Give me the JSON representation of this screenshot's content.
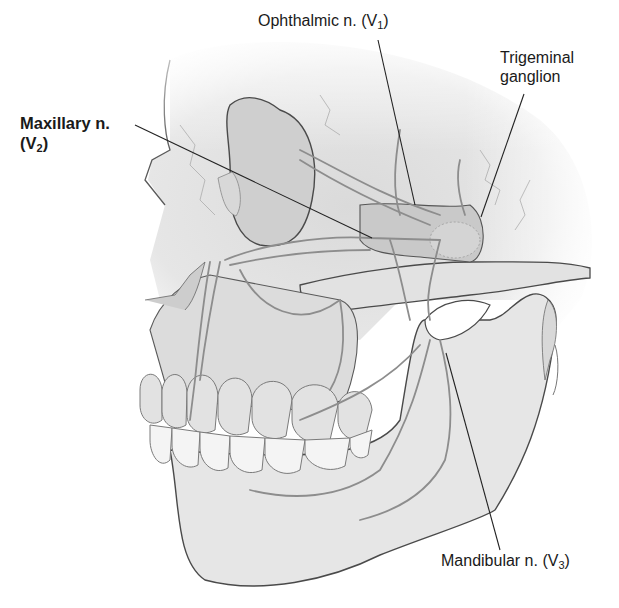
{
  "figure": {
    "colors": {
      "background": "#ffffff",
      "bone_fill": "#e4e4e4",
      "bone_shadow": "#cfcfcf",
      "outline": "#4a4a4a",
      "nerve": "#8d8d8d",
      "teeth": "#f2f2f2",
      "leader_line": "#222222",
      "label_text": "#1a1a1a"
    }
  },
  "labels": {
    "ophthalmic": {
      "main": "Ophthalmic n. (V",
      "sub": "1",
      "close": ")"
    },
    "trigeminal": {
      "line1": "Trigeminal",
      "line2": "ganglion"
    },
    "maxillary": {
      "line1": "Maxillary n.",
      "line2_main": "(V",
      "sub": "2",
      "close": ")"
    },
    "mandibular": {
      "main": "Mandibular n. (V",
      "sub": "3",
      "close": ")"
    }
  }
}
